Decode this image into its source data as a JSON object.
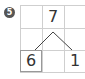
{
  "problem_number": "5",
  "number_bond": {
    "whole": "7",
    "parts": [
      "6",
      "1"
    ]
  },
  "colors": {
    "grid_line": "#cfcfcf",
    "text": "#333333",
    "badge": "#555555"
  }
}
